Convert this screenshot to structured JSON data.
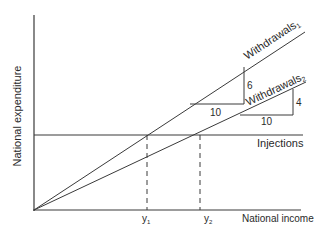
{
  "diagram": {
    "y_axis_label": "National expenditure",
    "x_axis_label": "National income",
    "lines": {
      "withdrawals1": {
        "label": "Withdrawals",
        "subscript": "1"
      },
      "withdrawals2": {
        "label": "Withdrawals",
        "subscript": "2"
      },
      "injections": {
        "label": "Injections"
      }
    },
    "slope_triangles": [
      {
        "for": "Withdrawals1",
        "run": "10",
        "rise": "6"
      },
      {
        "for": "Withdrawals2",
        "run": "10",
        "rise": "4"
      }
    ],
    "x_ticks": [
      {
        "label": "y",
        "subscript": "1"
      },
      {
        "label": "y",
        "subscript": "2"
      }
    ],
    "colors": {
      "line": "#3a3a3a",
      "text": "#2a2a2a",
      "background": "#ffffff"
    }
  }
}
